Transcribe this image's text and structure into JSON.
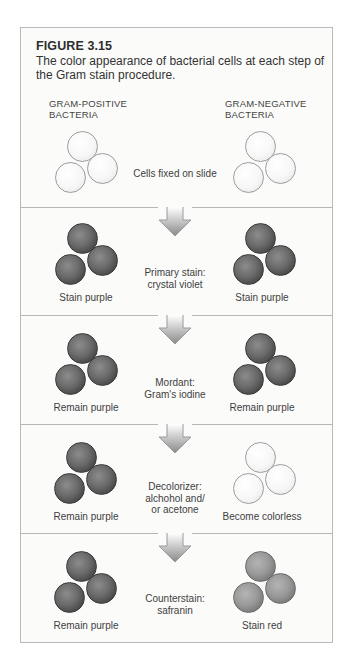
{
  "figure": {
    "number": "FIGURE 3.15",
    "caption": "The color appearance of bacterial cells at each step of the Gram stain procedure."
  },
  "columns": {
    "left": {
      "line1": "GRAM-POSITIVE",
      "line2": "BACTERIA"
    },
    "right": {
      "line1": "GRAM-NEGATIVE",
      "line2": "BACTERIA"
    }
  },
  "steps": [
    {
      "label_line1": "Cells fixed on slide",
      "label_line2": "",
      "label_line3": "",
      "left_result": "",
      "right_result": "",
      "left_color": "colorless",
      "right_color": "colorless"
    },
    {
      "label_line1": "Primary stain:",
      "label_line2": "crystal violet",
      "label_line3": "",
      "left_result": "Stain purple",
      "right_result": "Stain purple",
      "left_color": "purple",
      "right_color": "purple"
    },
    {
      "label_line1": "Mordant:",
      "label_line2": "Gram's iodine",
      "label_line3": "",
      "left_result": "Remain purple",
      "right_result": "Remain purple",
      "left_color": "purple",
      "right_color": "purple"
    },
    {
      "label_line1": "Decolorizer:",
      "label_line2": "alchohol and/",
      "label_line3": "or acetone",
      "left_result": "Remain purple",
      "right_result": "Become colorless",
      "left_color": "purple",
      "right_color": "colorless"
    },
    {
      "label_line1": "Counterstain:",
      "label_line2": "safranin",
      "label_line3": "",
      "left_result": "Remain purple",
      "right_result": "Stain red",
      "left_color": "purple",
      "right_color": "red"
    }
  ],
  "icons": {
    "arrow": "down-arrow-icon",
    "cell": "bacterial-cell-cluster"
  },
  "colors": {
    "border": "#b9b9b9",
    "purple_cell": "#555555",
    "red_cell": "#8f8f8f",
    "colorless_cell": "#f7f7f7",
    "arrow": "#9a9a9a"
  }
}
